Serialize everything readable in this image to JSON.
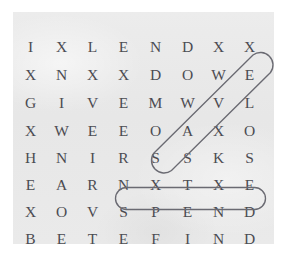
{
  "figure": {
    "kind": "word-search-puzzle",
    "page_background": "#ffffff",
    "panel_background": "#e9e9e9",
    "letter_color": "#4c4c52",
    "highlight_color": "#6a6a72"
  },
  "grid": {
    "rows": 8,
    "columns": 8,
    "letters": [
      [
        "I",
        "X",
        "L",
        "E",
        "N",
        "D",
        "X",
        "X"
      ],
      [
        "X",
        "N",
        "X",
        "X",
        "D",
        "O",
        "W",
        "E"
      ],
      [
        "G",
        "I",
        "V",
        "E",
        "M",
        "W",
        "V",
        "L"
      ],
      [
        "X",
        "W",
        "E",
        "E",
        "O",
        "A",
        "X",
        "O"
      ],
      [
        "H",
        "N",
        "I",
        "R",
        "S",
        "S",
        "K",
        "S"
      ],
      [
        "E",
        "A",
        "R",
        "N",
        "X",
        "T",
        "X",
        "E"
      ],
      [
        "X",
        "O",
        "V",
        "S",
        "P",
        "E",
        "N",
        "D"
      ],
      [
        "B",
        "E",
        "T",
        "E",
        "F",
        "I",
        "N",
        "D"
      ]
    ]
  },
  "found_words": [
    {
      "word": "SPEND",
      "orientation": "horizontal",
      "start": {
        "row": 7,
        "column": 4
      },
      "end": {
        "row": 7,
        "column": 8
      },
      "shape": "rounded-oval"
    },
    {
      "word": "SAVE",
      "orientation": "diagonal-up-right",
      "start": {
        "row": 5,
        "column": 5
      },
      "end": {
        "row": 2,
        "column": 8
      },
      "shape": "rounded-capsule"
    }
  ]
}
